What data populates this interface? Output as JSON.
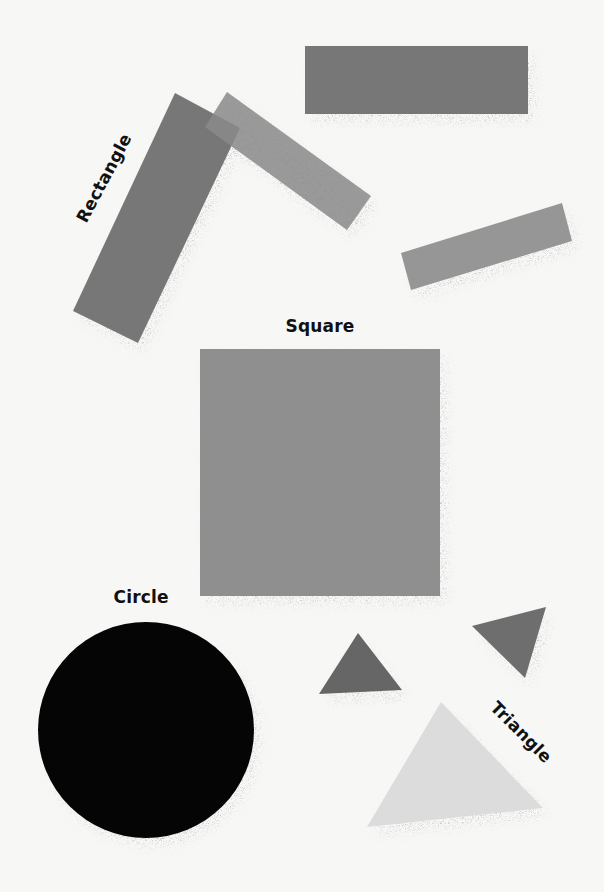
{
  "background": "#f7f7f6",
  "labels": {
    "rectangle": {
      "text": "Rectangle",
      "cx": 104,
      "cy": 178,
      "rotate": -62
    },
    "square": {
      "text": "Square",
      "cx": 320,
      "cy": 326,
      "rotate": 0
    },
    "circle": {
      "text": "Circle",
      "cx": 141,
      "cy": 597,
      "rotate": 0
    },
    "triangle": {
      "text": "Triangle",
      "cx": 521,
      "cy": 732,
      "rotate": 45
    }
  },
  "shapes": {
    "rectangles": [
      {
        "name": "top-rectangle",
        "points": "305,46 528,46 528,114 305,114",
        "fill": "#777777",
        "opacity": 1
      },
      {
        "name": "tall-tilted-rectangle",
        "points": "175,93 240,128 138,343 73,311",
        "fill": "#777777",
        "opacity": 1
      },
      {
        "name": "light-tilted-rectangle",
        "points": "227,92 371,196 347,230 205,127",
        "fill": "#8a8a8a",
        "opacity": 0.85
      },
      {
        "name": "right-tilted-rectangle",
        "points": "401,253 562,203 572,241 411,290",
        "fill": "#969696",
        "opacity": 1
      }
    ],
    "square": {
      "name": "square",
      "x": 200,
      "y": 349,
      "w": 240,
      "h": 247,
      "fill": "#8f8f8f"
    },
    "circle": {
      "name": "circle",
      "cx": 146,
      "cy": 730,
      "r": 108,
      "fill": "#050505"
    },
    "triangles": [
      {
        "name": "small-triangle",
        "points": "358,633 402,690 319,694",
        "fill": "#666666"
      },
      {
        "name": "tilted-triangle",
        "points": "472,626 546,607 525,678",
        "fill": "#6e6e6e"
      },
      {
        "name": "large-light-triangle",
        "points": "441,702 543,808 367,827",
        "fill": "#dcdcdc"
      }
    ]
  }
}
